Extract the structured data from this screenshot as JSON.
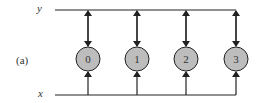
{
  "panel_label": "(a)",
  "line_top_label": "y",
  "line_bottom_label": "x",
  "nodes": [
    {
      "label": "0",
      "cx": 88
    },
    {
      "label": "1",
      "cx": 137
    },
    {
      "label": "2",
      "cx": 186
    },
    {
      "label": "3",
      "cx": 236
    }
  ],
  "colors": {
    "node_fill": "#bdbdbd",
    "stroke": "#222222"
  }
}
